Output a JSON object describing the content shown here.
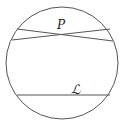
{
  "diagram": {
    "labels": {
      "point": "P",
      "line": "ℒ"
    },
    "stroke_color": "#555555",
    "background": "#ffffff",
    "circle": {
      "cx": 62,
      "cy": 63,
      "r": 56
    },
    "lines_through_P": [
      {
        "x1": 17,
        "y1": 29,
        "x2": 113,
        "y2": 41
      },
      {
        "x1": 12,
        "y1": 40,
        "x2": 110,
        "y2": 29
      }
    ],
    "line_L": {
      "x1": 17,
      "y1": 95,
      "x2": 110,
      "y2": 95
    }
  }
}
